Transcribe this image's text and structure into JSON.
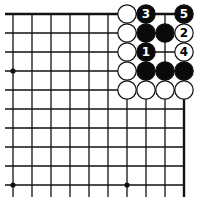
{
  "diagram": {
    "type": "go-problem",
    "corner": "top-right",
    "grid": {
      "columns": 10,
      "rows": 10,
      "origin_x": 13,
      "origin_y": 14,
      "spacing": 19,
      "edges": [
        "top",
        "right"
      ]
    },
    "colors": {
      "line": "#111111",
      "black_stone": "#0a0a0a",
      "white_stone": "#ffffff",
      "background": "#ffffff"
    },
    "star_points": [
      {
        "col": 0,
        "row": 3
      },
      {
        "col": 0,
        "row": 9
      },
      {
        "col": 6,
        "row": 9
      }
    ],
    "stones": [
      {
        "col": 6,
        "row": 0,
        "color": "white",
        "label": ""
      },
      {
        "col": 7,
        "row": 0,
        "color": "black",
        "label": "3"
      },
      {
        "col": 9,
        "row": 0,
        "color": "black",
        "label": "5"
      },
      {
        "col": 6,
        "row": 1,
        "color": "white",
        "label": ""
      },
      {
        "col": 7,
        "row": 1,
        "color": "black",
        "label": ""
      },
      {
        "col": 8,
        "row": 1,
        "color": "black",
        "label": ""
      },
      {
        "col": 9,
        "row": 1,
        "color": "white",
        "label": "2"
      },
      {
        "col": 6,
        "row": 2,
        "color": "white",
        "label": ""
      },
      {
        "col": 7,
        "row": 2,
        "color": "black",
        "label": "1"
      },
      {
        "col": 9,
        "row": 2,
        "color": "white",
        "label": "4"
      },
      {
        "col": 6,
        "row": 3,
        "color": "white",
        "label": ""
      },
      {
        "col": 7,
        "row": 3,
        "color": "black",
        "label": ""
      },
      {
        "col": 8,
        "row": 3,
        "color": "black",
        "label": ""
      },
      {
        "col": 9,
        "row": 3,
        "color": "black",
        "label": ""
      },
      {
        "col": 6,
        "row": 4,
        "color": "white",
        "label": ""
      },
      {
        "col": 7,
        "row": 4,
        "color": "white",
        "label": ""
      },
      {
        "col": 8,
        "row": 4,
        "color": "white",
        "label": ""
      },
      {
        "col": 9,
        "row": 4,
        "color": "white",
        "label": ""
      }
    ]
  }
}
